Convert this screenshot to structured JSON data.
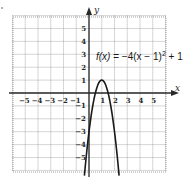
{
  "chart_data": {
    "type": "line",
    "title": "",
    "function_label": "f(x) = −4(x − 1)² + 1",
    "equation_parts": {
      "fx": "f(x)",
      "rhs": " = −4(x − 1)",
      "exp": "2",
      "tail": " + 1"
    },
    "xlabel": "x",
    "ylabel": "y",
    "xlim": [
      -6,
      6
    ],
    "ylim": [
      -6,
      6
    ],
    "grid": true,
    "grid_style": "dotted",
    "x_ticks": [
      -5,
      -4,
      -3,
      -2,
      -1,
      1,
      2,
      3,
      4,
      5
    ],
    "y_ticks": [
      5,
      4,
      3,
      2,
      1,
      -1,
      -2,
      -3,
      -4,
      -5
    ],
    "x_tick_labels": [
      "−5",
      "−4",
      "−3",
      "−2",
      "−1",
      "1",
      "2",
      "3",
      "4",
      "5"
    ],
    "y_tick_labels": [
      "5",
      "4",
      "3",
      "2",
      "1",
      "−1",
      "−2",
      "−3",
      "−4",
      "−5"
    ],
    "series": [
      {
        "name": "f(x) = -4(x-1)^2 + 1",
        "a": -4,
        "h": 1,
        "k": 1,
        "vertex": [
          1,
          1
        ],
        "x_intercepts": [
          0.5,
          1.5
        ],
        "y_intercept": -3,
        "x": [
          -0.25,
          0,
          0.25,
          0.5,
          0.75,
          1,
          1.25,
          1.5,
          1.75,
          2,
          2.25
        ],
        "y": [
          -5.25,
          -3,
          -1.25,
          0,
          0.75,
          1,
          0.75,
          0,
          -1.25,
          -3,
          -5.25
        ]
      }
    ],
    "colors": {
      "curve": "#1a1a1a",
      "axis": "#2a2a2a",
      "grid": "#8a8a8a"
    }
  }
}
